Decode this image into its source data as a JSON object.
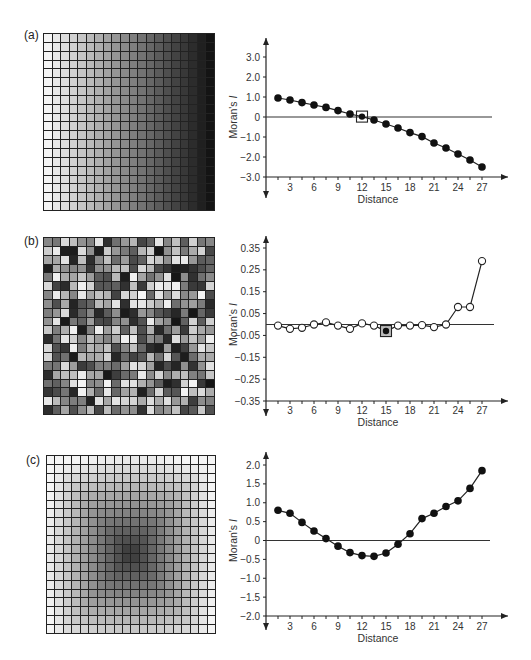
{
  "figure": {
    "panels": [
      {
        "label": "(a)",
        "grid": {
          "rows": 20,
          "cols": 20,
          "pattern": "horizontal-gradient",
          "description": "light on left to dark on right"
        },
        "chart": {
          "ylabel_main": "Moran's ",
          "ylabel_italic": "I",
          "xlabel": "Distance",
          "y_ticks": [
            "3.0",
            "2.0",
            "1.0",
            "0",
            "−1.0",
            "−2.0",
            "−3.0"
          ],
          "x_ticks": [
            "3",
            "6",
            "9",
            "12",
            "15",
            "18",
            "21",
            "24",
            "27"
          ]
        }
      },
      {
        "label": "(b)",
        "grid": {
          "rows": 20,
          "cols": 20,
          "pattern": "random",
          "description": "random gray levels"
        },
        "chart": {
          "ylabel_main": "Moran's ",
          "ylabel_italic": "I",
          "xlabel": "Distance",
          "y_ticks": [
            "0.35",
            "0.25",
            "0.15",
            "0.05",
            "−0.05",
            "−0.15",
            "−0.25",
            "−0.35"
          ],
          "x_ticks": [
            "3",
            "6",
            "9",
            "12",
            "15",
            "18",
            "21",
            "24",
            "27"
          ]
        }
      },
      {
        "label": "(c)",
        "grid": {
          "rows": 20,
          "cols": 20,
          "pattern": "radial-bowl",
          "description": "light border, dark center"
        },
        "chart": {
          "ylabel_main": "Moran's ",
          "ylabel_italic": "I",
          "xlabel": "Distance",
          "y_ticks": [
            "2.0",
            "1.5",
            "1.0",
            "0.5",
            "0",
            "−0.5",
            "−1.0",
            "−1.5",
            "−2.0"
          ],
          "x_ticks": [
            "3",
            "6",
            "9",
            "12",
            "15",
            "18",
            "21",
            "24",
            "27"
          ]
        }
      }
    ]
  },
  "chart_data": [
    {
      "type": "line",
      "title": "(a)",
      "xlabel": "Distance",
      "ylabel": "Moran's I",
      "xlim": [
        0,
        28
      ],
      "ylim": [
        -3.0,
        3.0
      ],
      "y_tick_values": [
        3.0,
        2.0,
        1.0,
        0,
        -1.0,
        -2.0,
        -3.0
      ],
      "x_tick_values": [
        3,
        6,
        9,
        12,
        15,
        18,
        21,
        24,
        27
      ],
      "marker": "filled-circle",
      "highlight": {
        "x": 12,
        "marker": "square"
      },
      "reference_line": 0,
      "x": [
        1.5,
        3,
        4.5,
        6,
        7.5,
        9,
        10.5,
        12,
        13.5,
        15,
        16.5,
        18,
        19.5,
        21,
        22.5,
        24,
        25.5,
        27
      ],
      "values": [
        0.95,
        0.85,
        0.72,
        0.6,
        0.48,
        0.32,
        0.15,
        0.02,
        -0.15,
        -0.35,
        -0.55,
        -0.78,
        -0.98,
        -1.3,
        -1.55,
        -1.85,
        -2.15,
        -2.5
      ]
    },
    {
      "type": "line",
      "title": "(b)",
      "xlabel": "Distance",
      "ylabel": "Moran's I",
      "xlim": [
        0,
        28
      ],
      "ylim": [
        -0.35,
        0.35
      ],
      "y_tick_values": [
        0.35,
        0.25,
        0.15,
        0.05,
        -0.05,
        -0.15,
        -0.25,
        -0.35
      ],
      "x_tick_values": [
        3,
        6,
        9,
        12,
        15,
        18,
        21,
        24,
        27
      ],
      "marker": "open-circle",
      "highlight": {
        "x": 15,
        "marker": "square-filled-dot"
      },
      "reference_line": 0,
      "x": [
        1.5,
        3,
        4.5,
        6,
        7.5,
        9,
        10.5,
        12,
        13.5,
        15,
        16.5,
        18,
        19.5,
        21,
        22.5,
        24,
        25.5,
        27
      ],
      "values": [
        -0.005,
        -0.02,
        -0.015,
        0.0,
        0.01,
        -0.005,
        -0.02,
        0.005,
        -0.005,
        -0.03,
        -0.005,
        -0.005,
        -0.003,
        -0.012,
        0.0,
        0.08,
        0.08,
        0.29
      ]
    },
    {
      "type": "line",
      "title": "(c)",
      "xlabel": "Distance",
      "ylabel": "Moran's I",
      "xlim": [
        0,
        28
      ],
      "ylim": [
        -2.0,
        2.0
      ],
      "y_tick_values": [
        2.0,
        1.5,
        1.0,
        0.5,
        0,
        -0.5,
        -1.0,
        -1.5,
        -2.0
      ],
      "x_tick_values": [
        3,
        6,
        9,
        12,
        15,
        18,
        21,
        24,
        27
      ],
      "marker": "filled-circle",
      "reference_line": 0,
      "x": [
        1.5,
        3,
        4.5,
        6,
        7.5,
        9,
        10.5,
        12,
        13.5,
        15,
        16.5,
        18,
        19.5,
        21,
        22.5,
        24,
        25.5,
        27
      ],
      "values": [
        0.8,
        0.72,
        0.48,
        0.25,
        0.05,
        -0.15,
        -0.32,
        -0.4,
        -0.42,
        -0.33,
        -0.1,
        0.18,
        0.58,
        0.72,
        0.9,
        1.05,
        1.38,
        1.85
      ]
    }
  ]
}
